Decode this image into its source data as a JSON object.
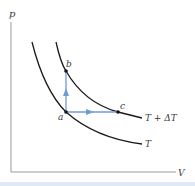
{
  "diagram": {
    "type": "pV isotherms",
    "axes": {
      "y_label": "p",
      "x_label": "V"
    },
    "curves": [
      {
        "id": "isotherm-high",
        "label": "T + ΔT"
      },
      {
        "id": "isotherm-low",
        "label": "T"
      }
    ],
    "points": [
      {
        "id": "a",
        "label": "a"
      },
      {
        "id": "b",
        "label": "b"
      },
      {
        "id": "c",
        "label": "c"
      }
    ],
    "arrows": [
      {
        "from": "a",
        "to": "b",
        "direction": "up"
      },
      {
        "from": "a",
        "to": "c",
        "direction": "right"
      }
    ],
    "colors": {
      "axis": "#9a9a9a",
      "curve": "#1a1a1a",
      "arrow": "#6f9bd8",
      "point": "#111111",
      "bottom_band": "#dfe9f5"
    }
  }
}
